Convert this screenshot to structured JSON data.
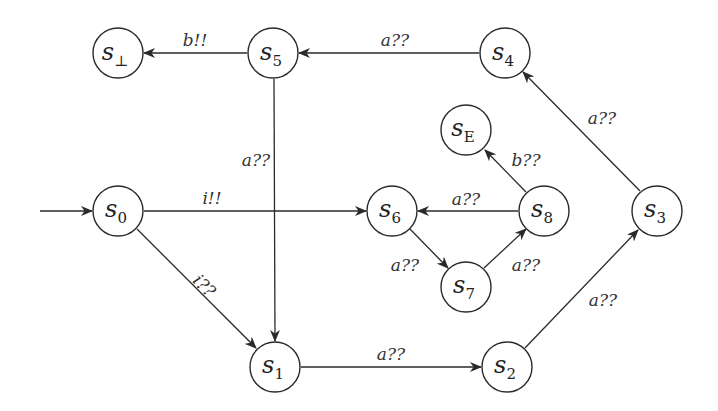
{
  "diagram": {
    "type": "state-machine",
    "initial_state": "s0",
    "nodes": [
      {
        "id": "s_bot",
        "base": "s",
        "sub": "⊥",
        "x": 118,
        "y": 53
      },
      {
        "id": "s5",
        "base": "s",
        "sub": "5",
        "x": 273,
        "y": 53
      },
      {
        "id": "s4",
        "base": "s",
        "sub": "4",
        "x": 505,
        "y": 53
      },
      {
        "id": "sE",
        "base": "s",
        "sub": "E",
        "x": 466,
        "y": 130
      },
      {
        "id": "s0",
        "base": "s",
        "sub": "0",
        "x": 118,
        "y": 211
      },
      {
        "id": "s6",
        "base": "s",
        "sub": "6",
        "x": 392,
        "y": 211
      },
      {
        "id": "s8",
        "base": "s",
        "sub": "8",
        "x": 544,
        "y": 211
      },
      {
        "id": "s3",
        "base": "s",
        "sub": "3",
        "x": 657,
        "y": 211
      },
      {
        "id": "s7",
        "base": "s",
        "sub": "7",
        "x": 466,
        "y": 287
      },
      {
        "id": "s1",
        "base": "s",
        "sub": "1",
        "x": 275,
        "y": 367
      },
      {
        "id": "s2",
        "base": "s",
        "sub": "2",
        "x": 507,
        "y": 367
      }
    ],
    "edges": [
      {
        "from": "s5",
        "to": "s_bot",
        "label": "b!!"
      },
      {
        "from": "s4",
        "to": "s5",
        "label": "a??"
      },
      {
        "from": "s5",
        "to": "s1",
        "label": "a??"
      },
      {
        "from": "s0",
        "to": "s6",
        "label": "i!!"
      },
      {
        "from": "s0",
        "to": "s1",
        "label": "i??"
      },
      {
        "from": "s1",
        "to": "s2",
        "label": "a??"
      },
      {
        "from": "s2",
        "to": "s3",
        "label": "a??"
      },
      {
        "from": "s3",
        "to": "s4",
        "label": "a??"
      },
      {
        "from": "s8",
        "to": "s6",
        "label": "a??"
      },
      {
        "from": "s6",
        "to": "s7",
        "label": "a??"
      },
      {
        "from": "s7",
        "to": "s8",
        "label": "a??"
      },
      {
        "from": "s8",
        "to": "sE",
        "label": "b??"
      }
    ]
  },
  "labels": {
    "n_bot": {
      "base": "s",
      "sub": "⊥"
    },
    "n5": {
      "base": "s",
      "sub": "5"
    },
    "n4": {
      "base": "s",
      "sub": "4"
    },
    "nE": {
      "base": "s",
      "sub": "E"
    },
    "n0": {
      "base": "s",
      "sub": "0"
    },
    "n6": {
      "base": "s",
      "sub": "6"
    },
    "n8": {
      "base": "s",
      "sub": "8"
    },
    "n3": {
      "base": "s",
      "sub": "3"
    },
    "n7": {
      "base": "s",
      "sub": "7"
    },
    "n1": {
      "base": "s",
      "sub": "1"
    },
    "n2": {
      "base": "s",
      "sub": "2"
    },
    "e_s5_sbot": "b!!",
    "e_s4_s5": "a??",
    "e_s5_s1": "a??",
    "e_s0_s6": "i!!",
    "e_s0_s1": "i??",
    "e_s1_s2": "a??",
    "e_s2_s3": "a??",
    "e_s3_s4": "a??",
    "e_s8_s6": "a??",
    "e_s6_s7": "a??",
    "e_s7_s8": "a??",
    "e_s8_sE": "b??"
  }
}
